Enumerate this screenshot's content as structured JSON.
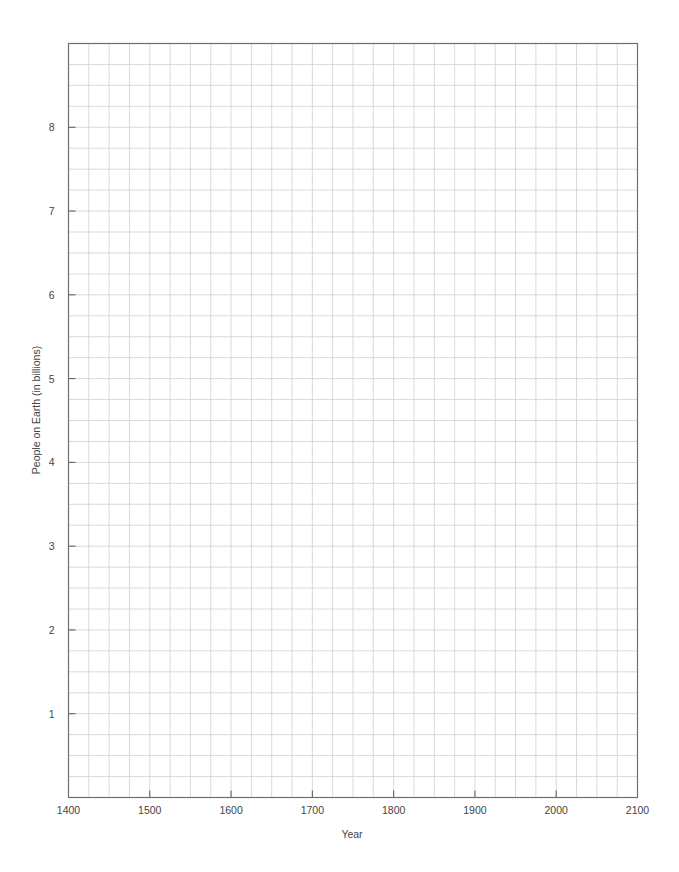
{
  "chart_data": {
    "type": "line",
    "title": "",
    "xlabel": "Year",
    "ylabel": "People on Earth (in billions)",
    "xlim": [
      1400,
      2100
    ],
    "ylim": [
      0,
      9
    ],
    "x_ticks": [
      1400,
      1500,
      1600,
      1700,
      1800,
      1900,
      2000,
      2100
    ],
    "x_tick_labels": [
      "1400",
      "1500",
      "1600",
      "1700",
      "1800",
      "1900",
      "2000",
      "2100"
    ],
    "y_ticks": [
      1,
      2,
      3,
      4,
      5,
      6,
      7,
      8
    ],
    "y_tick_labels": [
      "1",
      "2",
      "3",
      "4",
      "5",
      "6",
      "7",
      "8"
    ],
    "x_minor_step": 25,
    "y_minor_step": 0.25,
    "grid": true,
    "legend": null,
    "series": [],
    "note": "Blank graph grid — no data plotted"
  },
  "colors": {
    "grid": "#cfcfcf",
    "frame": "#6e6e6e",
    "text": "#444444",
    "background": "#ffffff"
  }
}
